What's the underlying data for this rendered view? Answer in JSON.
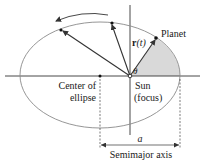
{
  "diagram": {
    "labels": {
      "planet": "Planet",
      "position_vector_bold": "r",
      "position_vector_arg": "(t)",
      "angle": "θ",
      "center": "Center of",
      "center_line2": "ellipse",
      "sun": "Sun",
      "sun_line2": "(focus)",
      "semimajor_symbol": "a",
      "semimajor": "Semimajor axis"
    },
    "colors": {
      "stroke": "#333333",
      "ellipse": "#8a8a8a",
      "shaded_area": "#d9d9d9",
      "background": "#ffffff"
    },
    "geometry": {
      "ellipse": {
        "cx": 100,
        "cy": 75,
        "rx": 80,
        "ry": 53
      },
      "sun": {
        "x": 130,
        "y": 76
      },
      "center": {
        "x": 100,
        "y": 76
      },
      "planet": {
        "x": 156,
        "y": 38
      },
      "orbit_points": [
        {
          "x": 61,
          "y": 30
        },
        {
          "x": 112,
          "y": 23
        }
      ]
    }
  }
}
